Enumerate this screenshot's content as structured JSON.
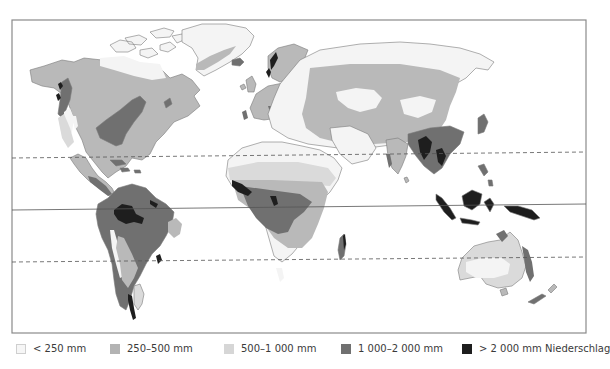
{
  "map": {
    "title": "Niederschlag (Jahresniederschlag) – Weltkarte",
    "lines": {
      "tropic_of_cancer": "dashed",
      "equator": "solid",
      "tropic_of_capricorn": "dashed"
    },
    "colors": {
      "frame": "#8a8a8a",
      "ocean": "#ffffff",
      "coast": "#7a7a7a",
      "class_lt_250": "#f3f3f3",
      "class_250_500": "#dadada",
      "class_500_1000": "#b9b9b9",
      "class_1000_2000": "#707070",
      "class_gt_2000": "#1e1e1e"
    }
  },
  "legend": {
    "items": [
      {
        "label": "< 250 mm",
        "color": "#f6f6f6"
      },
      {
        "label": "250–500 mm",
        "color": "#b3b3b3"
      },
      {
        "label": "500–1 000 mm",
        "color": "#d6d6d6"
      },
      {
        "label": "1 000–2 000 mm",
        "color": "#707070"
      },
      {
        "label": "> 2 000 mm Niederschlag",
        "color": "#1e1e1e"
      }
    ]
  }
}
